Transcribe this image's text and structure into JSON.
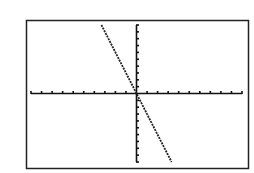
{
  "chart_data": {
    "type": "line",
    "title": "",
    "xlabel": "",
    "ylabel": "",
    "window": {
      "xmin": -10,
      "xmax": 10,
      "ymin": -10,
      "ymax": 10,
      "xscl": 1,
      "yscl": 1
    },
    "grid": false,
    "legend": null,
    "series": [
      {
        "name": "y = -3x",
        "equation": "y=-3x",
        "x": [
          -3.33,
          3.33
        ],
        "y": [
          10,
          -10
        ]
      }
    ]
  },
  "colors": {
    "background": "#ffffff",
    "frame": "#222222",
    "axis": "#111111",
    "plot": "#222222"
  }
}
